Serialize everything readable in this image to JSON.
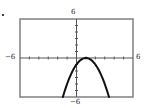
{
  "chart_data": {
    "type": "line",
    "title": "",
    "xlabel": "",
    "ylabel": "",
    "xlim": [
      -6,
      6
    ],
    "ylim": [
      -6,
      6
    ],
    "grid": false,
    "tick_interval": 1,
    "tick_labels": {
      "x_min": "-6",
      "x_max": "6",
      "y_min": "-6",
      "y_max": "6"
    },
    "series": [
      {
        "name": "y = -(x-1)^2",
        "equation": "y = -(x - 1)^2",
        "vertex": [
          1,
          0
        ],
        "y_intercept": -1,
        "x": [
          -1.45,
          -1,
          -0.5,
          0,
          0.5,
          1,
          1.5,
          2,
          2.5,
          3,
          3.45
        ],
        "y": [
          -6,
          -4,
          -2.25,
          -1,
          -0.25,
          0,
          -0.25,
          -1,
          -2.25,
          -4,
          -6
        ]
      }
    ]
  },
  "labels": {
    "top": "6",
    "bottom": "−6",
    "left": "−6",
    "right": "6"
  },
  "colors": {
    "frame": "#808080",
    "axis": "#555555",
    "curve": "#111111"
  }
}
